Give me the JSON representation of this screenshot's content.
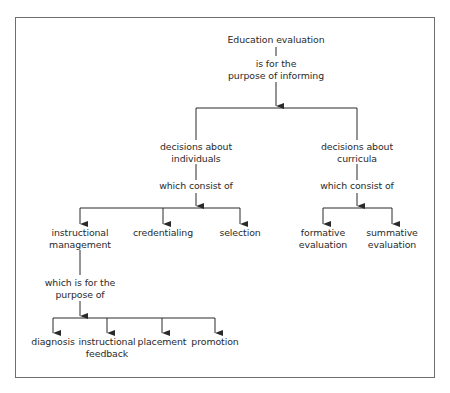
{
  "diagram": {
    "root": {
      "label": "Education evaluation"
    },
    "root_connector": {
      "label_line1": "is for the",
      "label_line2": "purpose of informing"
    },
    "branches": [
      {
        "label_line1": "decisions about",
        "label_line2": "individuals",
        "connector": "which consist of",
        "children": [
          {
            "label_line1": "instructional",
            "label_line2": "management",
            "connector_line1": "which is for the",
            "connector_line2": "purpose of",
            "children": [
              {
                "label_line1": "diagnosis",
                "label_line2": ""
              },
              {
                "label_line1": "instructional",
                "label_line2": "feedback"
              },
              {
                "label_line1": "placement",
                "label_line2": ""
              },
              {
                "label_line1": "promotion",
                "label_line2": ""
              }
            ]
          },
          {
            "label_line1": "credentialing",
            "label_line2": ""
          },
          {
            "label_line1": "selection",
            "label_line2": ""
          }
        ]
      },
      {
        "label_line1": "decisions about",
        "label_line2": "curricula",
        "connector": "which consist of",
        "children": [
          {
            "label_line1": "formative",
            "label_line2": "evaluation"
          },
          {
            "label_line1": "summative",
            "label_line2": "evaluation"
          }
        ]
      }
    ],
    "colors": {
      "line": "#2a2a2a",
      "frame": "#6e6e6e",
      "text": "#2a2a2a"
    }
  }
}
